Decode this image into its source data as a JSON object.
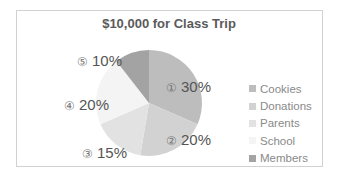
{
  "chart_data": {
    "type": "pie",
    "title": "$10,000 for Class Trip",
    "categories": [
      "Cookies",
      "Donations",
      "Parents",
      "School",
      "Members"
    ],
    "values": [
      30,
      20,
      15,
      20,
      10
    ],
    "labels": [
      "① 30%",
      "② 20%",
      "③ 15%",
      "④ 20%",
      "⑤ 10%"
    ],
    "colors": [
      "#bdbdbd",
      "#d2d2d2",
      "#e2e2e2",
      "#f4f4f4",
      "#a3a3a3"
    ],
    "legend_position": "right"
  },
  "title": "$10,000 for Class Trip",
  "slices": [
    {
      "num": "①",
      "pct": "30%",
      "name": "Cookies"
    },
    {
      "num": "②",
      "pct": "20%",
      "name": "Donations"
    },
    {
      "num": "③",
      "pct": "15%",
      "name": "Parents"
    },
    {
      "num": "④",
      "pct": "20%",
      "name": "School"
    },
    {
      "num": "⑤",
      "pct": "10%",
      "name": "Members"
    }
  ],
  "legend": [
    "Cookies",
    "Donations",
    "Parents",
    "School",
    "Members"
  ]
}
